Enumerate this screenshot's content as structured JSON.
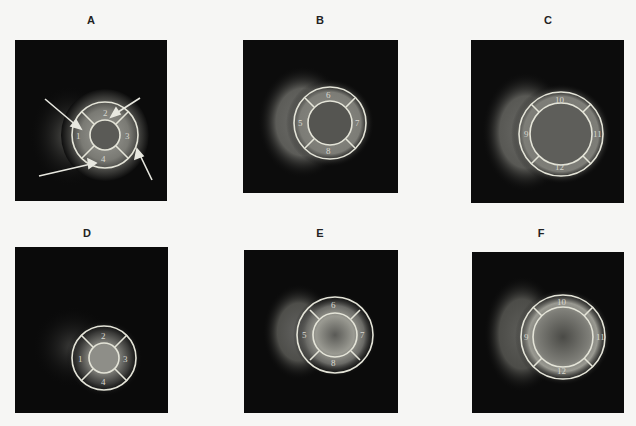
{
  "figure": {
    "panels": [
      {
        "id": "A",
        "label": "A",
        "view": "apical short-axis",
        "segments": [
          "1",
          "2",
          "3",
          "4"
        ],
        "arrows": 4
      },
      {
        "id": "B",
        "label": "B",
        "view": "mid short-axis",
        "segments": [
          "5",
          "6",
          "7",
          "8"
        ],
        "arrows": 0
      },
      {
        "id": "C",
        "label": "C",
        "view": "basal short-axis",
        "segments": [
          "9",
          "10",
          "11",
          "12"
        ],
        "arrows": 0
      },
      {
        "id": "D",
        "label": "D",
        "view": "apical short-axis",
        "segments": [
          "1",
          "2",
          "3",
          "4"
        ],
        "arrows": 0
      },
      {
        "id": "E",
        "label": "E",
        "view": "mid short-axis",
        "segments": [
          "5",
          "6",
          "7",
          "8"
        ],
        "arrows": 0
      },
      {
        "id": "F",
        "label": "F",
        "view": "basal short-axis",
        "segments": [
          "9",
          "10",
          "11",
          "12"
        ],
        "arrows": 0
      }
    ]
  },
  "colors": {
    "background": "#f6f6f4",
    "panel": "#0d0d0d",
    "overlay": "#e4e4d8",
    "label": "#222222"
  }
}
